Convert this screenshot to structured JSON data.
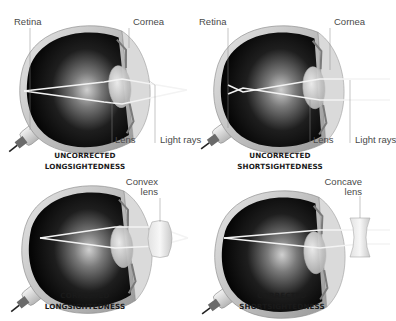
{
  "colors": {
    "background": "#ffffff",
    "label_text": "#4a4a4a",
    "title_text": "#1a1a1a",
    "eye_outer": "#d8d8d8",
    "eye_inner": "#111111",
    "rays": "#f2f2f2"
  },
  "panels": [
    {
      "id": "uncorrected-longsightedness",
      "title_line1": "UNCORRECTED",
      "title_line2": "LONGSIGHTEDNESS",
      "labels": {
        "retina": "Retina",
        "cornea": "Cornea",
        "lens": "Lens",
        "light_rays": "Light rays"
      }
    },
    {
      "id": "uncorrected-shortsightedness",
      "title_line1": "UNCORRECTED",
      "title_line2": "SHORTSIGHTEDNESS",
      "labels": {
        "retina": "Retina",
        "cornea": "Cornea",
        "lens": "Lens",
        "light_rays": "Light rays"
      }
    },
    {
      "id": "corrected-longsightedness",
      "title_line1": "CORRECTED",
      "title_line2": "LONGSIGHTEDNESS",
      "labels": {
        "corrective_lens_line1": "Convex",
        "corrective_lens_line2": "lens"
      }
    },
    {
      "id": "corrected-shortsightedness",
      "title_line1": "CORRECTED",
      "title_line2": "SHORTSIGHTEDNESS",
      "labels": {
        "corrective_lens_line1": "Concave",
        "corrective_lens_line2": "lens"
      }
    }
  ]
}
